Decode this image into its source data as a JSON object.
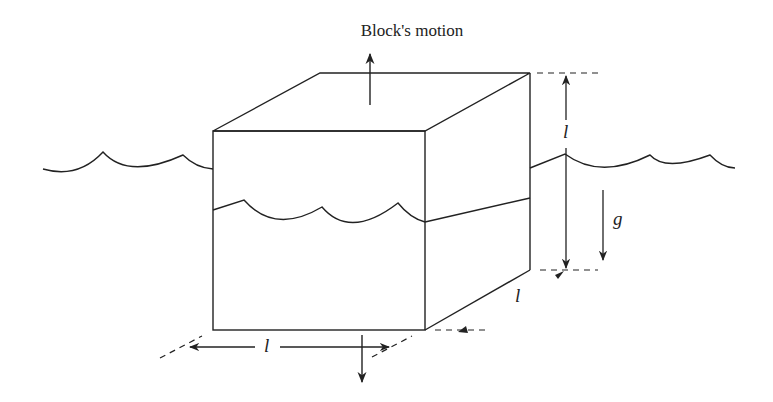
{
  "diagram": {
    "title": "Block's motion",
    "labels": {
      "height": "l",
      "width": "l",
      "depth": "l",
      "gravity": "g"
    },
    "colors": {
      "stroke": "#222222",
      "background": "#ffffff"
    },
    "elements": [
      "cube block partially submerged",
      "water surface waves outside block",
      "waterline on block front face",
      "upward motion arrow",
      "downward arrow below block",
      "gravity arrow",
      "dimension arrows for edge length l"
    ]
  }
}
